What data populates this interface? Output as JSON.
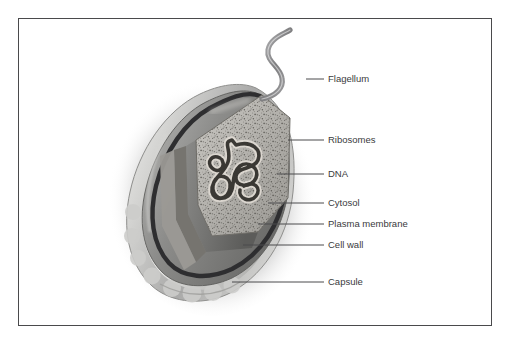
{
  "figure": {
    "title_visible": false,
    "style": "grayscale airbrush textbook diagram",
    "background_color": "#ffffff",
    "border_color": "#4a4a4c",
    "label_color": "#3a3a3c",
    "leader_color": "#4a4a4c"
  },
  "labels": [
    {
      "id": "flagellum",
      "text": "Flagellum",
      "text_x": 328,
      "text_y": 82,
      "leader_x1": 306,
      "leader_y1": 79,
      "leader_x2": 324,
      "leader_y2": 79
    },
    {
      "id": "ribosomes",
      "text": "Ribosomes",
      "text_x": 328,
      "text_y": 143,
      "leader_x1": 288,
      "leader_y1": 140,
      "leader_x2": 324,
      "leader_y2": 140
    },
    {
      "id": "dna",
      "text": "DNA",
      "text_x": 328,
      "text_y": 177,
      "leader_x1": 277,
      "leader_y1": 174,
      "leader_x2": 324,
      "leader_y2": 174
    },
    {
      "id": "cytosol",
      "text": "Cytosol",
      "text_x": 328,
      "text_y": 206,
      "leader_x1": 268,
      "leader_y1": 203,
      "leader_x2": 324,
      "leader_y2": 203
    },
    {
      "id": "plasma-membrane",
      "text": "Plasma membrane",
      "text_x": 328,
      "text_y": 227,
      "leader_x1": 258,
      "leader_y1": 224,
      "leader_x2": 324,
      "leader_y2": 224
    },
    {
      "id": "cell-wall",
      "text": "Cell wall",
      "text_x": 328,
      "text_y": 248,
      "leader_x1": 243,
      "leader_y1": 245,
      "leader_x2": 324,
      "leader_y2": 245
    },
    {
      "id": "capsule",
      "text": "Capsule",
      "text_x": 328,
      "text_y": 285,
      "leader_x1": 232,
      "leader_y1": 282,
      "leader_x2": 324,
      "leader_y2": 282
    }
  ],
  "structures": {
    "capsule": {
      "name": "Capsule",
      "fill": "#c9c9c9",
      "note": "scalloped lobed outer layer"
    },
    "cell_wall": {
      "name": "Cell wall",
      "fill": "#8e8e90"
    },
    "plasma_membrane": {
      "name": "Plasma membrane",
      "fill": "#2e2e30"
    },
    "cytosol": {
      "name": "Cytosol",
      "fill": "#b5b3ae",
      "note": "speckled with ribosomes"
    },
    "ribosomes": {
      "name": "Ribosomes",
      "fill": "#4e4c48",
      "note": "fine dark speckles in cytosol"
    },
    "dna": {
      "name": "DNA",
      "fill": "#3a3834",
      "note": "tangled coiled nucleoid loop"
    },
    "flagellum": {
      "name": "Flagellum",
      "fill": "#9a9a9c",
      "note": "wavy tapering tail from top right"
    },
    "shadow": {
      "name": "Drop shadow",
      "fill": "#000000"
    }
  }
}
